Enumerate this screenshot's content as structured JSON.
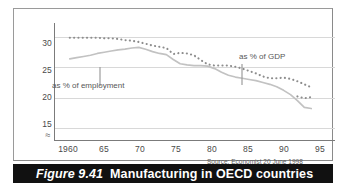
{
  "caption": {
    "number": "Figure 9.41",
    "title": "Manufacturing in OECD countries"
  },
  "source_note": "Source: Economist 20 June 1998",
  "annotations": {
    "employment": "as % of employment",
    "gdp": "as % of GDP"
  },
  "colors": {
    "caption_bar": "#111111",
    "caption_text": "#ffffff",
    "frame": "#9a9a9a",
    "gridline": "#d8d8d8",
    "axis": "#7b7b7b",
    "series_gdp": "#8d8d8d",
    "series_employment": "#c2c2c2",
    "tick_text": "#4a4a4a"
  },
  "chart_data": {
    "type": "line",
    "title": "Manufacturing in OECD countries",
    "subtitle": "",
    "xlabel": "",
    "ylabel": "",
    "xlim": [
      1958,
      1997
    ],
    "ylim": [
      13,
      32
    ],
    "grid": true,
    "grid_axis": "y",
    "legend": "inline-annotations",
    "y_ticks": [
      15,
      20,
      25,
      30
    ],
    "y_tick_labels": [
      "15",
      "20",
      "25",
      "30"
    ],
    "y_axis_break": true,
    "y_axis_break_symbol": "≈",
    "x_ticks": [
      1960,
      1965,
      1970,
      1975,
      1980,
      1985,
      1990,
      1995
    ],
    "x_tick_labels": [
      "1960",
      "65",
      "70",
      "75",
      "80",
      "85",
      "90",
      "95"
    ],
    "x": [
      1960,
      1961,
      1962,
      1963,
      1964,
      1965,
      1966,
      1967,
      1968,
      1969,
      1970,
      1971,
      1972,
      1973,
      1974,
      1975,
      1976,
      1977,
      1978,
      1979,
      1980,
      1981,
      1982,
      1983,
      1984,
      1985,
      1986,
      1987,
      1988,
      1989,
      1990,
      1991,
      1992,
      1993,
      1994,
      1995
    ],
    "series": [
      {
        "name": "as % of employment",
        "style": "dotted",
        "color": "#8d8d8d",
        "values": [
          29.9,
          29.9,
          29.9,
          29.9,
          29.9,
          29.8,
          29.8,
          29.7,
          29.5,
          29.4,
          29.2,
          28.9,
          28.6,
          28.4,
          28.2,
          27.2,
          27.4,
          27.3,
          27.0,
          26.2,
          25.5,
          25.3,
          25.3,
          25.3,
          25.1,
          24.8,
          24.4,
          24.0,
          23.5,
          23.2,
          23.2,
          23.3,
          23.1,
          22.7,
          22.2,
          21.7
        ]
      },
      {
        "name": "as % of GDP",
        "style": "solid",
        "color": "#c2c2c2",
        "values": [
          26.4,
          26.6,
          26.8,
          27.0,
          27.3,
          27.5,
          27.7,
          27.9,
          28.0,
          28.2,
          28.3,
          28.0,
          27.6,
          27.3,
          27.1,
          26.3,
          25.6,
          25.4,
          25.3,
          25.3,
          25.2,
          24.8,
          24.2,
          23.7,
          23.4,
          23.2,
          23.0,
          22.8,
          22.5,
          22.2,
          21.8,
          21.2,
          20.5,
          19.5,
          18.4,
          18.2
        ]
      }
    ],
    "series_tail": {
      "name": "as % of employment",
      "note": "dotted series flattens near 20 at the right edge",
      "x": [
        1993,
        1994,
        1995
      ],
      "values": [
        20.2,
        19.9,
        20.1
      ]
    }
  }
}
